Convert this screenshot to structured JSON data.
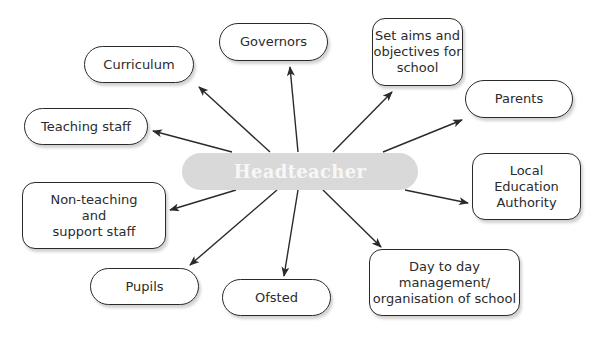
{
  "diagram": {
    "type": "spider-diagram",
    "center": {
      "label": "Headteacher",
      "fill": "#d9d9d9",
      "text_color": "#f7f7f7",
      "box": [
        182,
        153,
        236,
        37
      ]
    },
    "nodes": [
      {
        "id": "curriculum",
        "label": "Curriculum",
        "shape": "pill",
        "box": [
          84,
          46,
          110,
          37
        ],
        "arrow": [
          [
            270,
            152
          ],
          [
            199,
            87
          ]
        ]
      },
      {
        "id": "governors",
        "label": "Governors",
        "shape": "pill",
        "box": [
          219,
          23,
          109,
          38
        ],
        "arrow": [
          [
            298,
            152
          ],
          [
            290,
            67
          ]
        ]
      },
      {
        "id": "set-aims",
        "label": "Set aims and\nobjectives for\nschool",
        "shape": "rounded",
        "box": [
          372,
          18,
          91,
          68
        ],
        "arrow": [
          [
            333,
            152
          ],
          [
            392,
            92
          ]
        ]
      },
      {
        "id": "parents",
        "label": "Parents",
        "shape": "pill",
        "box": [
          465,
          80,
          108,
          38
        ],
        "arrow": [
          [
            383,
            152
          ],
          [
            462,
            120
          ]
        ]
      },
      {
        "id": "teaching-staff",
        "label": "Teaching staff",
        "shape": "pill",
        "box": [
          24,
          108,
          124,
          37
        ],
        "arrow": [
          [
            232,
            152
          ],
          [
            153,
            131
          ]
        ]
      },
      {
        "id": "lea",
        "label": "Local\nEducation\nAuthority",
        "shape": "rounded",
        "box": [
          472,
          153,
          109,
          67
        ],
        "arrow": [
          [
            405,
            190
          ],
          [
            468,
            203
          ]
        ]
      },
      {
        "id": "non-teaching",
        "label": "Non-teaching\nand\nsupport staff",
        "shape": "rounded",
        "box": [
          22,
          182,
          144,
          67
        ],
        "arrow": [
          [
            236,
            190
          ],
          [
            170,
            210
          ]
        ]
      },
      {
        "id": "pupils",
        "label": "Pupils",
        "shape": "pill",
        "box": [
          90,
          268,
          109,
          37
        ],
        "arrow": [
          [
            277,
            190
          ],
          [
            190,
            265
          ]
        ]
      },
      {
        "id": "ofsted",
        "label": "Ofsted",
        "shape": "pill",
        "box": [
          222,
          279,
          109,
          37
        ],
        "arrow": [
          [
            298,
            190
          ],
          [
            284,
            276
          ]
        ]
      },
      {
        "id": "day-to-day",
        "label": "Day to day\nmanagement/\norganisation of school",
        "shape": "rounded",
        "box": [
          369,
          249,
          151,
          67
        ],
        "arrow": [
          [
            323,
            190
          ],
          [
            381,
            247
          ]
        ]
      }
    ],
    "colors": {
      "line": "#2a2a2a",
      "node_border": "#2a2a2a",
      "node_text": "#2b2b2b",
      "background": "#ffffff"
    }
  }
}
